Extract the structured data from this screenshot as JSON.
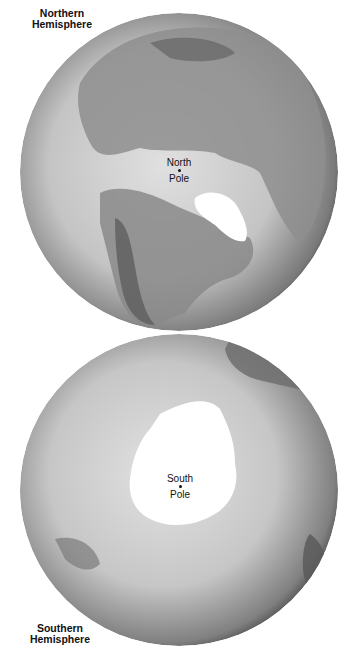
{
  "northern": {
    "label_line1": "Northern",
    "label_line2": "Hemisphere",
    "pole_line1": "North",
    "pole_line2": "Pole"
  },
  "southern": {
    "label_line1": "Southern",
    "label_line2": "Hemisphere",
    "pole_line1": "South",
    "pole_line2": "Pole"
  },
  "colors": {
    "ocean_light": "#d9d9d9",
    "ocean_dark": "#4a4a4a",
    "land": "#8c8c8c",
    "ice": "#ffffff"
  }
}
